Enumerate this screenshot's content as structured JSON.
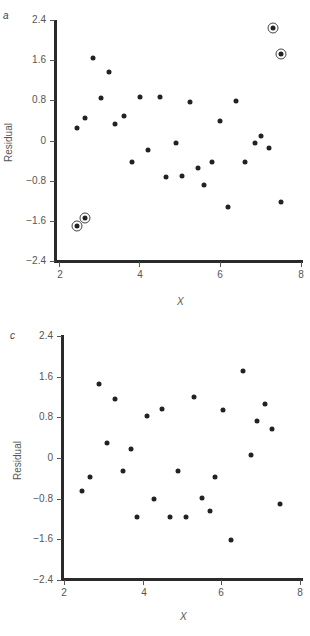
{
  "chart_data": [
    {
      "panel": "a",
      "type": "scatter",
      "title": "",
      "xlabel": "X",
      "ylabel": "Residual",
      "xlim": [
        2,
        8
      ],
      "ylim": [
        -2.4,
        2.4
      ],
      "xticks": [
        "2",
        "4",
        "6",
        "8"
      ],
      "yticks": [
        "2.4",
        "1.6",
        "0.8",
        "0",
        "−0.8",
        "−1.6",
        "−2.4"
      ],
      "grid": false,
      "legend": null,
      "annotations": "Four circled points mark outliers",
      "points": [
        {
          "x": 2.45,
          "y": 0.25
        },
        {
          "x": 2.65,
          "y": 0.45
        },
        {
          "x": 2.85,
          "y": 1.65
        },
        {
          "x": 3.05,
          "y": 0.85
        },
        {
          "x": 3.25,
          "y": 1.37
        },
        {
          "x": 3.4,
          "y": 0.32
        },
        {
          "x": 3.6,
          "y": 0.48
        },
        {
          "x": 3.8,
          "y": -0.42
        },
        {
          "x": 4.0,
          "y": 0.87
        },
        {
          "x": 4.2,
          "y": -0.18
        },
        {
          "x": 4.5,
          "y": 0.87
        },
        {
          "x": 4.65,
          "y": -0.73
        },
        {
          "x": 4.9,
          "y": -0.05
        },
        {
          "x": 5.05,
          "y": -0.7
        },
        {
          "x": 5.25,
          "y": 0.77
        },
        {
          "x": 5.45,
          "y": -0.55
        },
        {
          "x": 5.6,
          "y": -0.88
        },
        {
          "x": 5.8,
          "y": -0.42
        },
        {
          "x": 6.0,
          "y": 0.38
        },
        {
          "x": 6.2,
          "y": -1.32
        },
        {
          "x": 6.4,
          "y": 0.78
        },
        {
          "x": 6.6,
          "y": -0.42
        },
        {
          "x": 6.85,
          "y": -0.05
        },
        {
          "x": 7.0,
          "y": 0.08
        },
        {
          "x": 7.2,
          "y": -0.15
        },
        {
          "x": 7.5,
          "y": -1.22
        }
      ],
      "outliers": [
        {
          "x": 2.45,
          "y": -1.7
        },
        {
          "x": 2.65,
          "y": -1.55
        },
        {
          "x": 7.3,
          "y": 2.25
        },
        {
          "x": 7.5,
          "y": 1.72
        }
      ]
    },
    {
      "panel": "c",
      "type": "scatter",
      "title": "",
      "xlabel": "X",
      "ylabel": "Residual",
      "xlim": [
        2,
        8
      ],
      "ylim": [
        -2.4,
        2.4
      ],
      "xticks": [
        "2",
        "4",
        "6",
        "8"
      ],
      "yticks": [
        "2.4",
        "1.6",
        "0.8",
        "0",
        "−0.8",
        "−1.6",
        "−2.4"
      ],
      "grid": false,
      "legend": null,
      "points": [
        {
          "x": 2.45,
          "y": -0.65
        },
        {
          "x": 2.65,
          "y": -0.38
        },
        {
          "x": 2.9,
          "y": 1.45
        },
        {
          "x": 3.1,
          "y": 0.3
        },
        {
          "x": 3.3,
          "y": 1.17
        },
        {
          "x": 3.5,
          "y": -0.25
        },
        {
          "x": 3.7,
          "y": 0.17
        },
        {
          "x": 3.85,
          "y": -1.17
        },
        {
          "x": 4.1,
          "y": 0.82
        },
        {
          "x": 4.3,
          "y": -0.8
        },
        {
          "x": 4.5,
          "y": 0.97
        },
        {
          "x": 4.7,
          "y": -1.17
        },
        {
          "x": 4.9,
          "y": -0.25
        },
        {
          "x": 5.1,
          "y": -1.17
        },
        {
          "x": 5.3,
          "y": 1.2
        },
        {
          "x": 5.5,
          "y": -0.78
        },
        {
          "x": 5.7,
          "y": -1.05
        },
        {
          "x": 5.85,
          "y": -0.38
        },
        {
          "x": 6.05,
          "y": 0.95
        },
        {
          "x": 6.25,
          "y": -1.62
        },
        {
          "x": 6.55,
          "y": 1.72
        },
        {
          "x": 6.75,
          "y": 0.05
        },
        {
          "x": 6.9,
          "y": 0.72
        },
        {
          "x": 7.1,
          "y": 1.07
        },
        {
          "x": 7.3,
          "y": 0.57
        },
        {
          "x": 7.5,
          "y": -0.9
        }
      ]
    }
  ],
  "panels": {
    "a": {
      "letter": "a",
      "ylabel": "Residual",
      "xlabel": "X"
    },
    "c": {
      "letter": "c",
      "ylabel": "Residual",
      "xlabel": "X"
    }
  },
  "ticks": {
    "y": [
      "2.4",
      "1.6",
      "0.8",
      "0",
      "−0.8",
      "−1.6",
      "−2.4"
    ],
    "x": [
      "2",
      "4",
      "6",
      "8"
    ]
  }
}
